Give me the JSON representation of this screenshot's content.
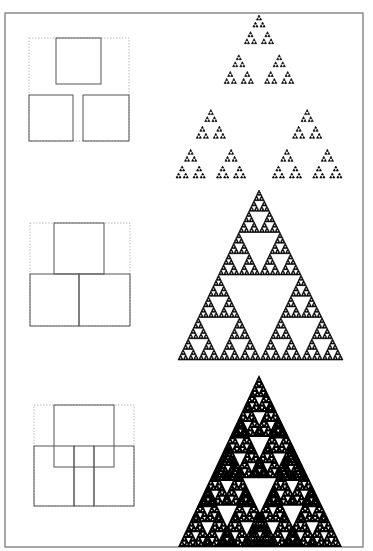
{
  "figure": {
    "width": 373,
    "height": 551,
    "background": "#ffffff",
    "frame": {
      "x": 5,
      "y": 13,
      "w": 358,
      "h": 534,
      "color": "#7a7a7a",
      "stroke": 1.3
    },
    "colors": {
      "box_solid": "#555555",
      "box_dotted": "#bbbbbb",
      "fractal": "#000000"
    }
  },
  "rows": [
    {
      "name": "row-1",
      "diagram": {
        "outline": {
          "x": 29,
          "y": 38,
          "w": 100,
          "h": 103
        },
        "boxes": [
          {
            "x": 56,
            "y": 38,
            "w": 45,
            "h": 46
          },
          {
            "x": 29,
            "y": 95,
            "w": 44,
            "h": 46
          },
          {
            "x": 83,
            "y": 95,
            "w": 46,
            "h": 46
          }
        ]
      },
      "fractal": {
        "apex": [
          259,
          15
        ],
        "base_left": [
          176,
          178
        ],
        "base_right": [
          342,
          178
        ],
        "ratio": 0.42,
        "depth": 5,
        "style": "separated"
      }
    },
    {
      "name": "row-2",
      "diagram": {
        "outline": {
          "x": 30,
          "y": 223,
          "w": 100,
          "h": 103
        },
        "boxes": [
          {
            "x": 54,
            "y": 223,
            "w": 50,
            "h": 51
          },
          {
            "x": 30,
            "y": 274,
            "w": 49,
            "h": 52
          },
          {
            "x": 79,
            "y": 274,
            "w": 51,
            "h": 52
          }
        ]
      },
      "fractal": {
        "apex": [
          259,
          190
        ],
        "base_left": [
          178,
          360
        ],
        "base_right": [
          343,
          360
        ],
        "ratio": 0.5,
        "depth": 6,
        "style": "touching"
      }
    },
    {
      "name": "row-3",
      "diagram": {
        "outline": {
          "x": 34,
          "y": 405,
          "w": 100,
          "h": 101
        },
        "boxes": [
          {
            "x": 54,
            "y": 405,
            "w": 60,
            "h": 62
          },
          {
            "x": 34,
            "y": 446,
            "w": 40,
            "h": 60
          },
          {
            "x": 74,
            "y": 446,
            "w": 20,
            "h": 60
          },
          {
            "x": 94,
            "y": 446,
            "w": 40,
            "h": 60
          }
        ]
      },
      "fractal": {
        "apex": [
          259,
          375
        ],
        "base_left": [
          178,
          547
        ],
        "base_right": [
          342,
          547
        ],
        "ratio": 0.6,
        "depth": 7,
        "style": "overlapping"
      }
    }
  ]
}
